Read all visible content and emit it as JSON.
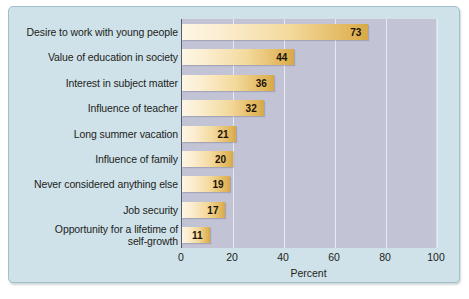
{
  "chart_data": {
    "type": "bar",
    "orientation": "horizontal",
    "title": "",
    "xlabel": "Percent",
    "ylabel": "",
    "xlim": [
      0,
      100
    ],
    "xticks": [
      "0",
      "20",
      "40",
      "60",
      "80",
      "100"
    ],
    "xtick_values": [
      0,
      20,
      40,
      60,
      80,
      100
    ],
    "grid": "vertical",
    "legend": "none",
    "categories": [
      "Desire to work with young people",
      "Value of education in society",
      "Interest in subject matter",
      "Influence of teacher",
      "Long summer vacation",
      "Influence of family",
      "Never considered anything else",
      "Job security",
      "Opportunity for a lifetime of self-growth"
    ],
    "category_lines": [
      [
        "Desire to work with young people"
      ],
      [
        "Value of education in society"
      ],
      [
        "Interest in subject matter"
      ],
      [
        "Influence of teacher"
      ],
      [
        "Long summer vacation"
      ],
      [
        "Influence of family"
      ],
      [
        "Never considered anything else"
      ],
      [
        "Job security"
      ],
      [
        "Opportunity for a lifetime of",
        "self-growth"
      ]
    ],
    "values": [
      73,
      44,
      36,
      32,
      21,
      20,
      19,
      17,
      11
    ],
    "value_labels": [
      "73",
      "44",
      "36",
      "32",
      "21",
      "20",
      "19",
      "17",
      "11"
    ]
  },
  "colors": {
    "panel_background": "#cfe2e9",
    "panel_border": "#9fc0cc",
    "plot_background": "#c3c3d6",
    "gridline": "#e9e9f3",
    "axis_line": "#5a5a6e",
    "bar_gradient_start": "#fdf6e4",
    "bar_gradient_end": "#d6a845",
    "text": "#1d1d20",
    "value_label_text": "#1a1308"
  }
}
